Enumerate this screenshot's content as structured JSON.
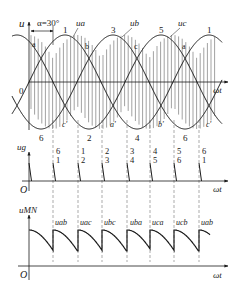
{
  "figure": {
    "colors": {
      "line": "#1a1a1a",
      "hatch": "#444444",
      "background": "#ffffff"
    },
    "top_panel": {
      "y_axis_label": "u",
      "x_axis_label": "ωt",
      "origin_label": "0",
      "alpha_label": "α=30°",
      "phase_labels": [
        "ua",
        "ub",
        "uc"
      ],
      "peak_numbers": [
        "1",
        "3",
        "5",
        "1"
      ],
      "upper_intersections": [
        "a",
        "b",
        "c",
        "a"
      ],
      "trough_numbers": [
        "6",
        "2",
        "4",
        "6"
      ],
      "lower_intersections": [
        "c'",
        "a'",
        "b'",
        "c'"
      ]
    },
    "middle_panel": {
      "y_axis_label": "ug",
      "x_axis_label": "ωt",
      "origin_label": "O",
      "pulse_pairs": [
        [
          "6",
          "1"
        ],
        [
          "1",
          "2"
        ],
        [
          "2",
          "3"
        ],
        [
          "3",
          "4"
        ],
        [
          "4",
          "5"
        ],
        [
          "5",
          "6"
        ],
        [
          "6",
          "1"
        ]
      ]
    },
    "bottom_panel": {
      "y_axis_label": "uMN",
      "x_axis_label": "ωt",
      "origin_label": "O",
      "segment_labels": [
        "uab",
        "uac",
        "ubc",
        "uba",
        "uca",
        "ucb",
        "uab"
      ]
    }
  }
}
